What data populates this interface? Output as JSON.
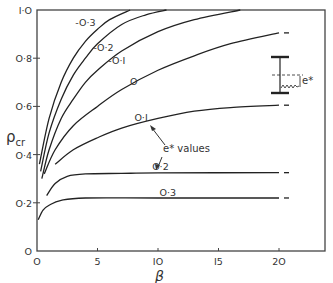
{
  "chart_data": {
    "type": "line",
    "title": "",
    "xlabel": "β",
    "ylabel": "ρcr",
    "xlim": [
      0,
      23.5
    ],
    "ylim": [
      0,
      1.0
    ],
    "grid": false,
    "x_ticks": [
      0,
      5,
      10,
      15,
      20
    ],
    "x_tick_labels": [
      "O",
      "5",
      "IO",
      "I5",
      "2O"
    ],
    "y_ticks": [
      0,
      0.2,
      0.4,
      0.6,
      0.8,
      1.0
    ],
    "y_tick_labels": [
      "O",
      "O·2",
      "O·4",
      "O·6",
      "O·8",
      "I·O"
    ],
    "legend_annotation": "e* values",
    "inset_label": "e*",
    "series": [
      {
        "name": "-O·3",
        "e_star": -0.3,
        "points": [
          [
            0.2,
            0.36
          ],
          [
            1,
            0.55
          ],
          [
            2,
            0.7
          ],
          [
            3,
            0.8
          ],
          [
            4,
            0.87
          ],
          [
            5,
            0.92
          ],
          [
            6,
            0.96
          ],
          [
            7.7,
            1.0
          ]
        ]
      },
      {
        "name": "-O·2",
        "e_star": -0.2,
        "points": [
          [
            0.3,
            0.33
          ],
          [
            1,
            0.49
          ],
          [
            2,
            0.63
          ],
          [
            3,
            0.73
          ],
          [
            4,
            0.8
          ],
          [
            5,
            0.86
          ],
          [
            7,
            0.94
          ],
          [
            9,
            0.98
          ],
          [
            10.7,
            1.0
          ]
        ]
      },
      {
        "name": "-O·I",
        "e_star": -0.1,
        "points": [
          [
            0.4,
            0.3
          ],
          [
            1,
            0.42
          ],
          [
            2,
            0.55
          ],
          [
            3,
            0.63
          ],
          [
            4,
            0.7
          ],
          [
            5,
            0.75
          ],
          [
            7,
            0.83
          ],
          [
            10,
            0.91
          ],
          [
            13,
            0.96
          ],
          [
            16.8,
            1.0
          ]
        ]
      },
      {
        "name": "O",
        "e_star": 0.0,
        "points": [
          [
            0.6,
            0.32
          ],
          [
            1.5,
            0.42
          ],
          [
            3,
            0.52
          ],
          [
            5,
            0.6
          ],
          [
            7,
            0.67
          ],
          [
            10,
            0.75
          ],
          [
            13,
            0.81
          ],
          [
            16,
            0.86
          ],
          [
            20,
            0.905
          ]
        ]
      },
      {
        "name": "O·I",
        "e_star": 0.1,
        "points": [
          [
            1.5,
            0.36
          ],
          [
            3,
            0.42
          ],
          [
            5,
            0.47
          ],
          [
            7,
            0.51
          ],
          [
            10,
            0.55
          ],
          [
            13,
            0.58
          ],
          [
            16,
            0.595
          ],
          [
            20,
            0.605
          ]
        ]
      },
      {
        "name": "O·2",
        "e_star": 0.2,
        "points": [
          [
            0.8,
            0.23
          ],
          [
            1.5,
            0.28
          ],
          [
            2.5,
            0.31
          ],
          [
            4,
            0.32
          ],
          [
            7,
            0.322
          ],
          [
            10,
            0.324
          ],
          [
            20,
            0.325
          ]
        ]
      },
      {
        "name": "O·3",
        "e_star": 0.3,
        "points": [
          [
            0.1,
            0.13
          ],
          [
            0.5,
            0.17
          ],
          [
            1,
            0.19
          ],
          [
            2,
            0.21
          ],
          [
            4,
            0.22
          ],
          [
            10,
            0.22
          ],
          [
            20,
            0.22
          ]
        ]
      }
    ],
    "curve_labels": [
      {
        "text": "-O·3",
        "x": 4.0,
        "y": 0.935
      },
      {
        "text": "-O·2",
        "x": 5.5,
        "y": 0.83
      },
      {
        "text": "-O·I",
        "x": 6.6,
        "y": 0.775
      },
      {
        "text": "O",
        "x": 8.0,
        "y": 0.69
      },
      {
        "text": "O·I",
        "x": 8.6,
        "y": 0.54
      },
      {
        "text": "O·2",
        "x": 10.2,
        "y": 0.335
      },
      {
        "text": "O·3",
        "x": 10.8,
        "y": 0.23
      }
    ]
  }
}
